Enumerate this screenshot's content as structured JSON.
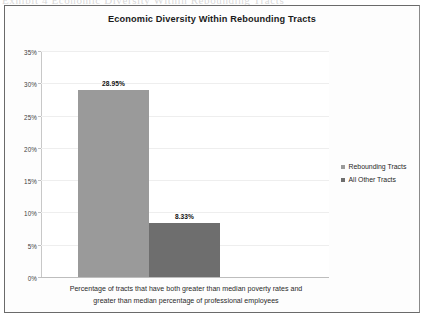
{
  "page": {
    "bleed_text": "Exhibit 4  Economic Diversity Within Rebounding Tracts"
  },
  "chart_data": {
    "type": "bar",
    "title": "Economic Diversity Within Rebounding Tracts",
    "categories": [
      "Rebounding Tracts",
      "All Other Tracts"
    ],
    "values": [
      28.95,
      8.33
    ],
    "value_labels": [
      "28.95%",
      "8.33%"
    ],
    "xlabel": "Percentage of tracts that have both greater than median poverty rates and greater than median percentage of professional employees",
    "ylabel": "",
    "ylim": [
      0,
      35
    ],
    "ytick_values": [
      0,
      5,
      10,
      15,
      20,
      25,
      30,
      35
    ],
    "ytick_labels": [
      "0%",
      "5%",
      "10%",
      "15%",
      "20%",
      "25%",
      "30%",
      "35%"
    ],
    "grid": true,
    "legend_position": "right",
    "legend": [
      {
        "label": "Rebounding Tracts",
        "color": "#9a9a9a"
      },
      {
        "label": "All Other Tracts",
        "color": "#6e6e6e"
      }
    ],
    "series": [
      {
        "name": "Rebounding Tracts",
        "value": 28.95,
        "color": "#9a9a9a"
      },
      {
        "name": "All Other Tracts",
        "value": 8.33,
        "color": "#6e6e6e"
      }
    ]
  },
  "caption": {
    "line1": "Percentage of tracts that have both greater than median poverty rates and",
    "line2": "greater than median percentage of professional employees"
  }
}
